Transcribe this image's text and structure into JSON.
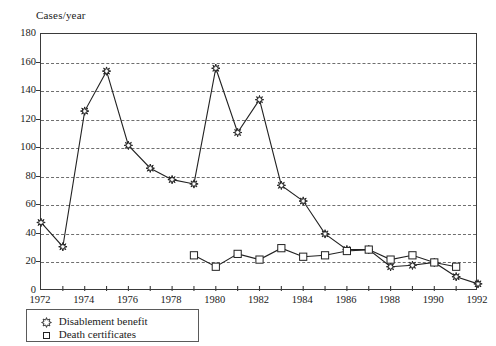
{
  "chart_data": {
    "type": "line",
    "title": "",
    "ylabel": "Cases/year",
    "xlabel": "",
    "ylim": [
      0,
      180
    ],
    "xlim": [
      1972,
      1992
    ],
    "ytick_step": 20,
    "grid": true,
    "legend_position": "below-left",
    "y_ticks": [
      "0",
      "20",
      "40",
      "60",
      "80",
      "100",
      "120",
      "140",
      "160",
      "180"
    ],
    "x_ticks": [
      "1972",
      "1974",
      "1976",
      "1978",
      "1980",
      "1982",
      "1984",
      "1986",
      "1988",
      "1990",
      "1992"
    ],
    "x_minor_years": [
      1973,
      1975,
      1977,
      1979,
      1981,
      1983,
      1985,
      1987,
      1989,
      1991
    ],
    "x": [
      1972,
      1973,
      1974,
      1975,
      1976,
      1977,
      1978,
      1979,
      1980,
      1981,
      1982,
      1983,
      1984,
      1985,
      1986,
      1987,
      1988,
      1989,
      1990,
      1991,
      1992
    ],
    "series": [
      {
        "name": "Disablement benefit",
        "marker": "star",
        "color": "#222222",
        "x": [
          1972,
          1973,
          1974,
          1975,
          1976,
          1977,
          1978,
          1979,
          1980,
          1981,
          1982,
          1983,
          1984,
          1985,
          1986,
          1987,
          1988,
          1989,
          1990,
          1991,
          1992
        ],
        "values": [
          48,
          31,
          126,
          154,
          102,
          86,
          78,
          75,
          156,
          111,
          134,
          74,
          63,
          40,
          29,
          29,
          17,
          18,
          20,
          10,
          5
        ]
      },
      {
        "name": "Death certificates",
        "marker": "square",
        "color": "#222222",
        "x": [
          1979,
          1980,
          1981,
          1982,
          1983,
          1984,
          1985,
          1986,
          1987,
          1988,
          1989,
          1990,
          1991
        ],
        "values": [
          25,
          17,
          26,
          22,
          30,
          24,
          25,
          28,
          29,
          22,
          25,
          20,
          17
        ]
      }
    ]
  },
  "legend": {
    "items": [
      {
        "label": "Disablement benefit",
        "marker": "star"
      },
      {
        "label": "Death certificates",
        "marker": "square"
      }
    ]
  }
}
